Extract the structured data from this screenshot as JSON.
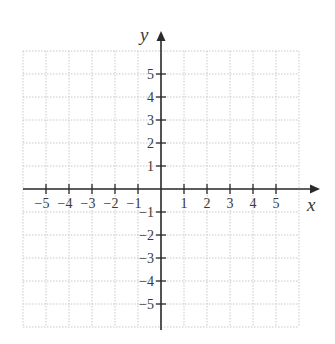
{
  "diagram": {
    "type": "cartesian-coordinate-plane",
    "x_axis": {
      "label": "x",
      "range": [
        -6,
        6
      ],
      "tick_labels": [
        "-5",
        "-4",
        "-3",
        "-2",
        "-1",
        "1",
        "2",
        "3",
        "4",
        "5"
      ],
      "tick_values": [
        -5,
        -4,
        -3,
        -2,
        -1,
        1,
        2,
        3,
        4,
        5
      ]
    },
    "y_axis": {
      "label": "y",
      "range": [
        -6,
        6
      ],
      "tick_labels": [
        "5",
        "4",
        "3",
        "2",
        "1",
        "-1",
        "-2",
        "-3",
        "-4",
        "-5"
      ],
      "tick_values": [
        5,
        4,
        3,
        2,
        1,
        -1,
        -2,
        -3,
        -4,
        -5
      ]
    },
    "grid": {
      "style": "dotted",
      "spacing": 1,
      "extent": [
        -6,
        6
      ]
    },
    "colors": {
      "axis": "#2b2b2b",
      "grid": "#c8c8c8",
      "text": "#3a3a3a",
      "background": "#ffffff"
    }
  }
}
